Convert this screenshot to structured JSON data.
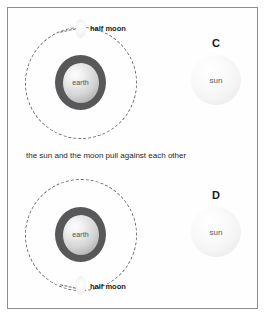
{
  "figure": {
    "caption": "the sun and the moon pull against each other",
    "panels": [
      {
        "option_letter": "C",
        "earth_label": "earth",
        "moon_label": "half moon",
        "sun_label": "sun",
        "moon_position": "top"
      },
      {
        "option_letter": "D",
        "earth_label": "earth",
        "moon_label": "half moon",
        "sun_label": "sun",
        "moon_position": "bottom"
      }
    ]
  },
  "colors": {
    "frame_border": "#8d8d8d",
    "orbit_dash": "#6f6f6f",
    "earth_ring": "#58585a",
    "earth_core_light": "#fdfdfd",
    "sun_fill": "#f4f4f4",
    "text": "#1a1a1a",
    "background": "#ffffff"
  }
}
